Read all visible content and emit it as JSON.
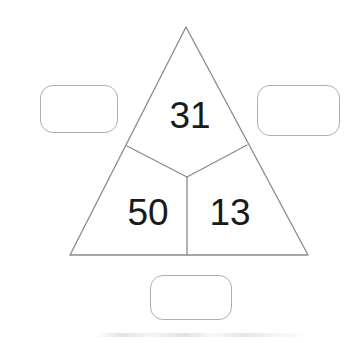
{
  "canvas": {
    "width": 354,
    "height": 343,
    "background": "#ffffff"
  },
  "diagram": {
    "type": "partitioned-triangle-number-puzzle",
    "shape": "triangle",
    "stroke_color": "#8a8a8a",
    "stroke_width": 1.3,
    "fill": "#ffffff",
    "vertices": {
      "apex": [
        186,
        27
      ],
      "bottom_left": [
        70,
        255
      ],
      "bottom_right": [
        308,
        255
      ]
    },
    "partition": {
      "description": "Y-shaped divider splitting the triangle into three regions",
      "junction": [
        187,
        177
      ],
      "branch_left_end": [
        127,
        146
      ],
      "branch_right_end": [
        247,
        145
      ],
      "branch_bottom_end": [
        187,
        255
      ]
    },
    "regions": [
      {
        "name": "top-region",
        "value": "31",
        "center": [
          190,
          115
        ]
      },
      {
        "name": "bottom-left-region",
        "value": "50",
        "center": [
          148,
          212
        ]
      },
      {
        "name": "bottom-right-region",
        "value": "13",
        "center": [
          230,
          212
        ]
      }
    ]
  },
  "answer_boxes": [
    {
      "name": "left-answer-box",
      "value": "",
      "placeholder": "",
      "x": 40,
      "y": 85,
      "width": 78,
      "height": 48,
      "border_color": "#aeaeae"
    },
    {
      "name": "right-answer-box",
      "value": "",
      "placeholder": "",
      "x": 257,
      "y": 85,
      "width": 83,
      "height": 51,
      "border_color": "#aeaeae"
    },
    {
      "name": "bottom-answer-box",
      "value": "",
      "placeholder": "",
      "x": 150,
      "y": 275,
      "width": 82,
      "height": 45,
      "border_color": "#aeaeae"
    }
  ]
}
